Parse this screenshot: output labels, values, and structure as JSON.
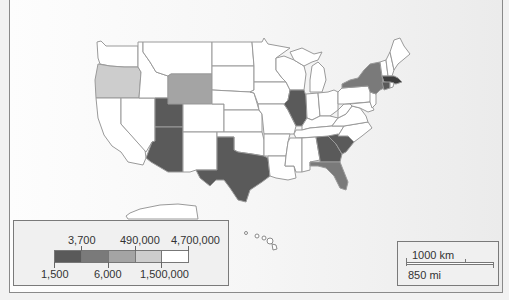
{
  "map": {
    "title": "US states choropleth",
    "colors": {
      "class1": "#5a5a5a",
      "class2": "#7a7a7a",
      "class3": "#a4a4a4",
      "class4": "#cdcdcd",
      "class5": "#ffffff"
    },
    "shaded_states": [
      {
        "state": "Oregon",
        "class": "class4"
      },
      {
        "state": "Wyoming",
        "class": "class3"
      },
      {
        "state": "Utah",
        "class": "class1"
      },
      {
        "state": "Arizona",
        "class": "class1"
      },
      {
        "state": "Texas",
        "class": "class1"
      },
      {
        "state": "Illinois",
        "class": "class1"
      },
      {
        "state": "Georgia",
        "class": "class1"
      },
      {
        "state": "South Carolina",
        "class": "class1"
      },
      {
        "state": "Florida",
        "class": "class2"
      },
      {
        "state": "New York",
        "class": "class2"
      },
      {
        "state": "Connecticut",
        "class": "class1"
      },
      {
        "state": "Massachusetts",
        "class": "class1"
      }
    ]
  },
  "legend": {
    "top_labels": [
      "3,700",
      "490,000",
      "4,700,000"
    ],
    "bottom_labels": [
      "1,500",
      "6,000",
      "1,500,000"
    ],
    "classes": [
      "class1",
      "class2",
      "class3",
      "class4",
      "class5"
    ]
  },
  "scale_bar": {
    "km_label": "1000 km",
    "mi_label": "850 mi"
  }
}
